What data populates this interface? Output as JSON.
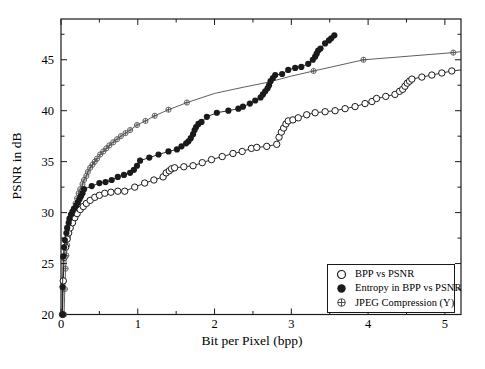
{
  "figure": {
    "background": "#ffffff",
    "frame_color": "#1a1a1a",
    "series_color": "#1a1a1a",
    "jpeg_color": "#4d4d4d"
  },
  "chart_data": {
    "type": "line",
    "title": "",
    "xlabel": "Bit per Pixel (bpp)",
    "ylabel": "PSNR in dB",
    "xlim": [
      0,
      5.21
    ],
    "ylim": [
      20,
      49
    ],
    "grid": false,
    "xticks": {
      "major": [
        0,
        1,
        2,
        3,
        4,
        5
      ],
      "minor_step": 0.5
    },
    "yticks": {
      "major": [
        20,
        25,
        30,
        35,
        40,
        45
      ],
      "minor_step": 2.5
    },
    "layout": {
      "left": 61,
      "right": 461,
      "top": 19,
      "bottom": 314.5
    },
    "legend_position": "lower-right",
    "series": [
      {
        "name": "JPEG Compression (Y)",
        "marker": "circle-plus",
        "color": "#4d4d4d",
        "points": [
          [
            0.04,
            20
          ],
          [
            0.05,
            22.5
          ],
          [
            0.06,
            24.5
          ],
          [
            0.07,
            25.8
          ],
          [
            0.08,
            26.8
          ],
          [
            0.09,
            27.6
          ],
          [
            0.1,
            28.3
          ],
          [
            0.12,
            28.9
          ],
          [
            0.13,
            29.4
          ],
          [
            0.15,
            29.9
          ],
          [
            0.17,
            30.4
          ],
          [
            0.19,
            30.9
          ],
          [
            0.21,
            31.4
          ],
          [
            0.23,
            31.9
          ],
          [
            0.25,
            32.3
          ],
          [
            0.28,
            32.8
          ],
          [
            0.3,
            33.2
          ],
          [
            0.33,
            33.6
          ],
          [
            0.35,
            34.0
          ],
          [
            0.38,
            34.4
          ],
          [
            0.41,
            34.7
          ],
          [
            0.44,
            35.0
          ],
          [
            0.47,
            35.3
          ],
          [
            0.51,
            35.7
          ],
          [
            0.55,
            36.0
          ],
          [
            0.59,
            36.3
          ],
          [
            0.63,
            36.6
          ],
          [
            0.68,
            36.9
          ],
          [
            0.73,
            37.2
          ],
          [
            0.78,
            37.5
          ],
          [
            0.84,
            37.8
          ],
          [
            0.9,
            38.1
          ],
          [
            0.99,
            38.6
          ],
          [
            1.1,
            39.0
          ],
          [
            1.22,
            39.5
          ],
          [
            1.4,
            40.1
          ],
          [
            1.64,
            40.8
          ],
          [
            3.29,
            43.9
          ],
          [
            3.94,
            45.0
          ],
          [
            5.11,
            45.7
          ]
        ],
        "extra_line_points": [
          [
            2.0,
            41.7
          ],
          [
            2.37,
            42.3
          ],
          [
            2.7,
            42.8
          ],
          [
            3.0,
            43.4
          ],
          [
            5.21,
            45.8
          ]
        ]
      },
      {
        "name": "BPP vs PSNR",
        "marker": "open-circle",
        "color": "#1a1a1a",
        "points": [
          [
            0.02,
            20
          ],
          [
            0.03,
            23.3
          ],
          [
            0.04,
            25.6
          ],
          [
            0.06,
            26.6
          ],
          [
            0.08,
            27.4
          ],
          [
            0.1,
            28.0
          ],
          [
            0.12,
            28.5
          ],
          [
            0.15,
            29.0
          ],
          [
            0.18,
            29.5
          ],
          [
            0.21,
            29.9
          ],
          [
            0.25,
            30.3
          ],
          [
            0.29,
            30.6
          ],
          [
            0.33,
            30.9
          ],
          [
            0.38,
            31.2
          ],
          [
            0.44,
            31.5
          ],
          [
            0.5,
            31.7
          ],
          [
            0.57,
            31.9
          ],
          [
            0.65,
            32.0
          ],
          [
            0.74,
            32.1
          ],
          [
            0.83,
            32.1
          ],
          [
            0.96,
            32.5
          ],
          [
            1.09,
            32.9
          ],
          [
            1.21,
            33.2
          ],
          [
            1.33,
            33.5
          ],
          [
            1.37,
            33.9
          ],
          [
            1.41,
            34.1
          ],
          [
            1.44,
            34.3
          ],
          [
            1.48,
            34.4
          ],
          [
            1.6,
            34.5
          ],
          [
            1.72,
            34.6
          ],
          [
            1.84,
            34.9
          ],
          [
            1.96,
            35.2
          ],
          [
            2.1,
            35.5
          ],
          [
            2.24,
            35.8
          ],
          [
            2.36,
            36.0
          ],
          [
            2.48,
            36.3
          ],
          [
            2.55,
            36.4
          ],
          [
            2.68,
            36.5
          ],
          [
            2.81,
            36.7
          ],
          [
            2.84,
            37.4
          ],
          [
            2.87,
            37.9
          ],
          [
            2.9,
            38.3
          ],
          [
            2.93,
            38.7
          ],
          [
            2.96,
            39.0
          ],
          [
            3.02,
            39.1
          ],
          [
            3.09,
            39.3
          ],
          [
            3.2,
            39.6
          ],
          [
            3.31,
            39.8
          ],
          [
            3.44,
            39.9
          ],
          [
            3.57,
            40.0
          ],
          [
            3.7,
            40.2
          ],
          [
            3.83,
            40.4
          ],
          [
            3.96,
            40.7
          ],
          [
            4.05,
            40.9
          ],
          [
            4.11,
            41.2
          ],
          [
            4.23,
            41.4
          ],
          [
            4.35,
            41.6
          ],
          [
            4.41,
            41.9
          ],
          [
            4.45,
            42.1
          ],
          [
            4.48,
            42.4
          ],
          [
            4.51,
            42.7
          ],
          [
            4.54,
            42.9
          ],
          [
            4.57,
            43.1
          ],
          [
            4.7,
            43.3
          ],
          [
            4.83,
            43.5
          ],
          [
            4.96,
            43.7
          ],
          [
            5.09,
            43.9
          ]
        ],
        "extra_line_points": [
          [
            5.21,
            44.0
          ]
        ]
      },
      {
        "name": "Entropy in BPP vs PSNR",
        "marker": "filled-circle",
        "color": "#1a1a1a",
        "points": [
          [
            0.02,
            20
          ],
          [
            0.02,
            22.7
          ],
          [
            0.03,
            25.7
          ],
          [
            0.04,
            26.6
          ],
          [
            0.05,
            27.3
          ],
          [
            0.07,
            28.0
          ],
          [
            0.08,
            28.5
          ],
          [
            0.1,
            29.0
          ],
          [
            0.11,
            29.4
          ],
          [
            0.13,
            29.8
          ],
          [
            0.15,
            30.1
          ],
          [
            0.17,
            30.4
          ],
          [
            0.2,
            30.7
          ],
          [
            0.22,
            31.0
          ],
          [
            0.24,
            31.3
          ],
          [
            0.26,
            31.6
          ],
          [
            0.28,
            31.9
          ],
          [
            0.3,
            32.3
          ],
          [
            0.4,
            32.6
          ],
          [
            0.5,
            32.9
          ],
          [
            0.58,
            33.0
          ],
          [
            0.66,
            33.2
          ],
          [
            0.74,
            33.5
          ],
          [
            0.82,
            33.7
          ],
          [
            0.9,
            33.9
          ],
          [
            0.95,
            34.2
          ],
          [
            0.99,
            34.6
          ],
          [
            1.03,
            35.1
          ],
          [
            1.15,
            35.4
          ],
          [
            1.27,
            35.7
          ],
          [
            1.4,
            36.0
          ],
          [
            1.51,
            36.2
          ],
          [
            1.57,
            36.5
          ],
          [
            1.63,
            36.8
          ],
          [
            1.66,
            37.0
          ],
          [
            1.69,
            37.3
          ],
          [
            1.72,
            37.7
          ],
          [
            1.74,
            38.1
          ],
          [
            1.76,
            38.4
          ],
          [
            1.79,
            38.7
          ],
          [
            1.83,
            38.9
          ],
          [
            1.9,
            39.4
          ],
          [
            2.03,
            39.8
          ],
          [
            2.18,
            40.0
          ],
          [
            2.31,
            40.2
          ],
          [
            2.37,
            40.4
          ],
          [
            2.46,
            40.7
          ],
          [
            2.53,
            41.0
          ],
          [
            2.6,
            41.3
          ],
          [
            2.63,
            41.6
          ],
          [
            2.66,
            41.9
          ],
          [
            2.69,
            42.2
          ],
          [
            2.71,
            42.5
          ],
          [
            2.73,
            42.9
          ],
          [
            2.76,
            43.2
          ],
          [
            2.79,
            43.5
          ],
          [
            2.88,
            43.6
          ],
          [
            2.96,
            44.0
          ],
          [
            3.05,
            44.2
          ],
          [
            3.13,
            44.3
          ],
          [
            3.22,
            44.6
          ],
          [
            3.28,
            45.0
          ],
          [
            3.31,
            45.3
          ],
          [
            3.33,
            45.6
          ],
          [
            3.35,
            45.9
          ],
          [
            3.38,
            46.1
          ],
          [
            3.44,
            46.6
          ],
          [
            3.49,
            46.9
          ],
          [
            3.52,
            47.1
          ],
          [
            3.56,
            47.4
          ]
        ],
        "extra_line_points": []
      }
    ]
  },
  "legend": {
    "items": [
      {
        "label": "BPP vs PSNR",
        "marker": "open-circle"
      },
      {
        "label": "Entropy in BPP vs PSNR",
        "marker": "filled-circle"
      },
      {
        "label": "JPEG Compression (Y)",
        "marker": "circle-plus"
      }
    ]
  }
}
